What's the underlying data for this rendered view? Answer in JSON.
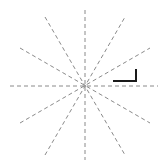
{
  "figure": {
    "canvas": {
      "width": 164,
      "height": 167,
      "background": "#ffffff"
    },
    "center": {
      "x": 85,
      "y": 86
    },
    "style": {
      "line_color": "#8a8a8a",
      "line_width": 1,
      "dash_pattern": "4 3",
      "marker_color": "#1a1a1a",
      "marker_width": 2
    },
    "lines": [
      {
        "name": "ray-line-0deg",
        "angle_deg": 0,
        "x1": 10,
        "y1": 86,
        "x2": 158,
        "y2": 86
      },
      {
        "name": "ray-line-30deg",
        "angle_deg": 30,
        "x1": 20,
        "y1": 123,
        "x2": 150,
        "y2": 48
      },
      {
        "name": "ray-line-60deg",
        "angle_deg": 60,
        "x1": 45,
        "y1": 155,
        "x2": 125,
        "y2": 17
      },
      {
        "name": "ray-line-90deg",
        "angle_deg": 90,
        "x1": 85,
        "y1": 10,
        "x2": 85,
        "y2": 160
      },
      {
        "name": "ray-line-120deg",
        "angle_deg": 120,
        "x1": 45,
        "y1": 17,
        "x2": 125,
        "y2": 155
      },
      {
        "name": "ray-line-150deg",
        "angle_deg": 150,
        "x1": 20,
        "y1": 48,
        "x2": 150,
        "y2": 123
      }
    ],
    "angle_marker": {
      "name": "right-angle-marker",
      "shape": "L",
      "points": "113,81 136,81 136,69"
    }
  }
}
